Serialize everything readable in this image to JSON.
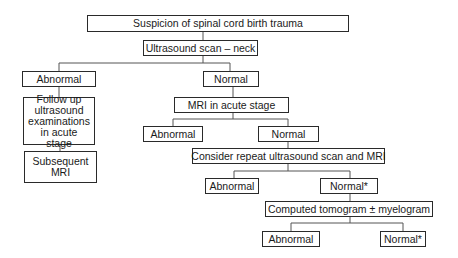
{
  "diagram": {
    "type": "flowchart",
    "nodes": {
      "root": "Suspicion of spinal cord birth trauma",
      "ultrasound": "Ultrasound scan – neck",
      "us_abnormal": "Abnormal",
      "us_normal": "Normal",
      "followup": "Follow up ultrasound examinations in acute stage",
      "subsequent_mri": "Subsequent MRI",
      "mri_acute": "MRI in acute stage",
      "mri_abnormal": "Abnormal",
      "mri_normal": "Normal",
      "repeat": "Consider repeat ultrasound scan and MRI",
      "repeat_abnormal": "Abnormal",
      "repeat_normal": "Normal*",
      "ct": "Computed tomogram ± myelogram",
      "ct_abnormal": "Abnormal",
      "ct_normal": "Normal*"
    },
    "edges": [
      [
        "root",
        "ultrasound"
      ],
      [
        "ultrasound",
        "us_abnormal"
      ],
      [
        "ultrasound",
        "us_normal"
      ],
      [
        "us_abnormal",
        "followup"
      ],
      [
        "followup",
        "subsequent_mri"
      ],
      [
        "us_normal",
        "mri_acute"
      ],
      [
        "mri_acute",
        "mri_abnormal"
      ],
      [
        "mri_acute",
        "mri_normal"
      ],
      [
        "mri_normal",
        "repeat"
      ],
      [
        "repeat",
        "repeat_abnormal"
      ],
      [
        "repeat",
        "repeat_normal"
      ],
      [
        "repeat_normal",
        "ct"
      ],
      [
        "ct",
        "ct_abnormal"
      ],
      [
        "ct",
        "ct_normal"
      ]
    ]
  }
}
